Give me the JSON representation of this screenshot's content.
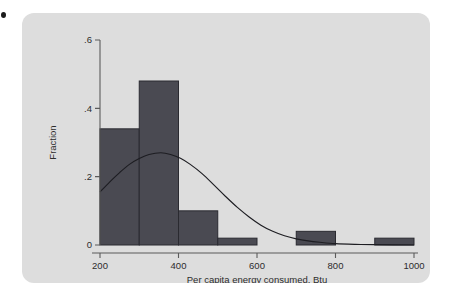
{
  "figure": {
    "background_color": "#ffffff",
    "card_color": "#dddddd",
    "bar_color": "#4a4a52",
    "bar_edge_color": "#2a2a30",
    "axis_color": "#5b5b5b",
    "curve_color": "#1d1d22",
    "marker_label": ""
  },
  "chart_data": {
    "type": "bar",
    "title": "",
    "subtitle": "",
    "xlabel": "Per capita energy consumed, Btu",
    "ylabel": "Fraction",
    "xlim": [
      200,
      1000
    ],
    "ylim": [
      0,
      0.6
    ],
    "grid": false,
    "legend_position": "none",
    "xticks": [
      200,
      400,
      600,
      800,
      1000
    ],
    "xtick_labels": [
      "200",
      "400",
      "600",
      "800",
      "1000"
    ],
    "yticks": [
      0,
      0.2,
      0.4,
      0.6
    ],
    "ytick_labels": [
      "0",
      ".2",
      ".4",
      ".6"
    ],
    "bin_width": 100,
    "bins": [
      {
        "x0": 200,
        "x1": 300,
        "value": 0.34
      },
      {
        "x0": 300,
        "x1": 400,
        "value": 0.48
      },
      {
        "x0": 400,
        "x1": 500,
        "value": 0.1
      },
      {
        "x0": 500,
        "x1": 600,
        "value": 0.02
      },
      {
        "x0": 600,
        "x1": 700,
        "value": 0.0
      },
      {
        "x0": 700,
        "x1": 800,
        "value": 0.04
      },
      {
        "x0": 800,
        "x1": 900,
        "value": 0.0
      },
      {
        "x0": 900,
        "x1": 1000,
        "value": 0.02
      }
    ],
    "overlay": {
      "name": "normal-density",
      "type": "line",
      "mean": 355,
      "sd": 145,
      "peak_value": 0.27,
      "points": [
        {
          "x": 200,
          "y": 0.155
        },
        {
          "x": 225,
          "y": 0.185
        },
        {
          "x": 250,
          "y": 0.212
        },
        {
          "x": 275,
          "y": 0.236
        },
        {
          "x": 300,
          "y": 0.253
        },
        {
          "x": 325,
          "y": 0.265
        },
        {
          "x": 355,
          "y": 0.27
        },
        {
          "x": 380,
          "y": 0.265
        },
        {
          "x": 405,
          "y": 0.254
        },
        {
          "x": 430,
          "y": 0.236
        },
        {
          "x": 460,
          "y": 0.209
        },
        {
          "x": 490,
          "y": 0.176
        },
        {
          "x": 520,
          "y": 0.142
        },
        {
          "x": 550,
          "y": 0.11
        },
        {
          "x": 580,
          "y": 0.082
        },
        {
          "x": 610,
          "y": 0.058
        },
        {
          "x": 640,
          "y": 0.04
        },
        {
          "x": 670,
          "y": 0.027
        },
        {
          "x": 700,
          "y": 0.018
        },
        {
          "x": 730,
          "y": 0.012
        },
        {
          "x": 760,
          "y": 0.008
        },
        {
          "x": 800,
          "y": 0.004
        },
        {
          "x": 850,
          "y": 0.002
        },
        {
          "x": 900,
          "y": 0.001
        },
        {
          "x": 1000,
          "y": 0.0
        }
      ]
    }
  }
}
